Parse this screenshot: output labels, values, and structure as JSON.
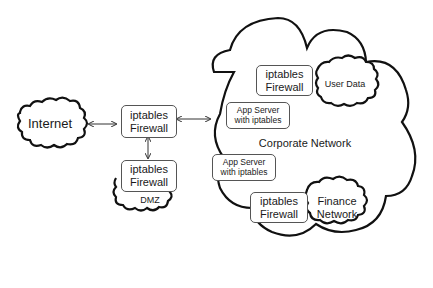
{
  "diagram": {
    "clouds": {
      "internet": "Internet",
      "dmz": "DMZ",
      "corporate": "Corporate Network",
      "user_data": "User Data",
      "finance": [
        "Finance",
        "Network"
      ]
    },
    "firewalls": {
      "main": [
        "iptables",
        "Firewall"
      ],
      "dmz": [
        "iptables",
        "Firewall"
      ],
      "user_data": [
        "iptables",
        "Firewall"
      ],
      "finance": [
        "iptables",
        "Firewall"
      ]
    },
    "app_servers": [
      [
        "App Server",
        "with iptables"
      ],
      [
        "App Server",
        "with iptables"
      ]
    ],
    "colors": {
      "stroke": "#111111",
      "box_border": "#555555",
      "background": "#ffffff"
    }
  }
}
